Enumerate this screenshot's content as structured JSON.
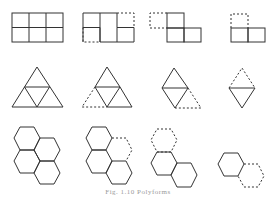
{
  "figure": {
    "caption": "Fig. 1.10  Polyforms",
    "stroke_color": "#333333",
    "dashed_color": "#444444",
    "rows": [
      {
        "name": "squares",
        "items": [
          {
            "label": "full 2x3 grid",
            "removed": "none"
          },
          {
            "label": "bottom-left and top-right removed",
            "removed": "2 cells dashed"
          },
          {
            "label": "top-left dashed",
            "removed": "1 cell dashed"
          },
          {
            "label": "top-left dashed over two cells",
            "removed": "1 cell dashed"
          }
        ]
      },
      {
        "name": "triangles",
        "items": [
          {
            "label": "4-triangle large triangle",
            "removed": "none"
          },
          {
            "label": "left corner dashed",
            "removed": "1 triangle dashed"
          },
          {
            "label": "rhombus with dashed right triangle",
            "removed": "1 triangle dashed"
          },
          {
            "label": "rhombus with dashed top triangle",
            "removed": "1 triangle dashed"
          }
        ]
      },
      {
        "name": "hexagons",
        "items": [
          {
            "label": "4-hexagon cluster",
            "removed": "none"
          },
          {
            "label": "cluster with dashed right hex",
            "removed": "1 hex dashed"
          },
          {
            "label": "pair with dashed top hex",
            "removed": "1 hex dashed"
          },
          {
            "label": "single hex with dashed neighbor",
            "removed": "1 hex dashed"
          }
        ]
      }
    ]
  }
}
